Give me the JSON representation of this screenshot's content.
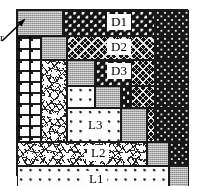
{
  "figure": {
    "annotation": {
      "label": "r",
      "icon": "arrow-icon",
      "points_to": "top-left diagonal block"
    }
  },
  "labels": {
    "d1": "D1",
    "d2": "D2",
    "d3": "D3",
    "l3": "L3",
    "l2": "L2",
    "l1": "L1"
  },
  "colors": {
    "dark_fill": "#141414",
    "light_fill": "#fdfdfd",
    "gray_block": "#a9a9a9",
    "border": "#1a1a1a",
    "label_bg": "#ffffff",
    "label_text": "#000000"
  },
  "blocks": [
    {
      "name": "diag-level0",
      "texture": "gray-checker",
      "label": ""
    },
    {
      "name": "offdiag-d1",
      "texture": "dark-dotted",
      "label": "D1"
    },
    {
      "name": "offdiag-d2",
      "texture": "dark-diamond",
      "label": "D2"
    },
    {
      "name": "offdiag-d3",
      "texture": "dark-dotted",
      "label": "D3"
    },
    {
      "name": "offdiag-l1",
      "texture": "light-dotted",
      "label": "L1"
    },
    {
      "name": "offdiag-l2",
      "texture": "speckle",
      "label": "L2"
    },
    {
      "name": "offdiag-l3",
      "texture": "light-dotted",
      "label": "L3"
    }
  ]
}
